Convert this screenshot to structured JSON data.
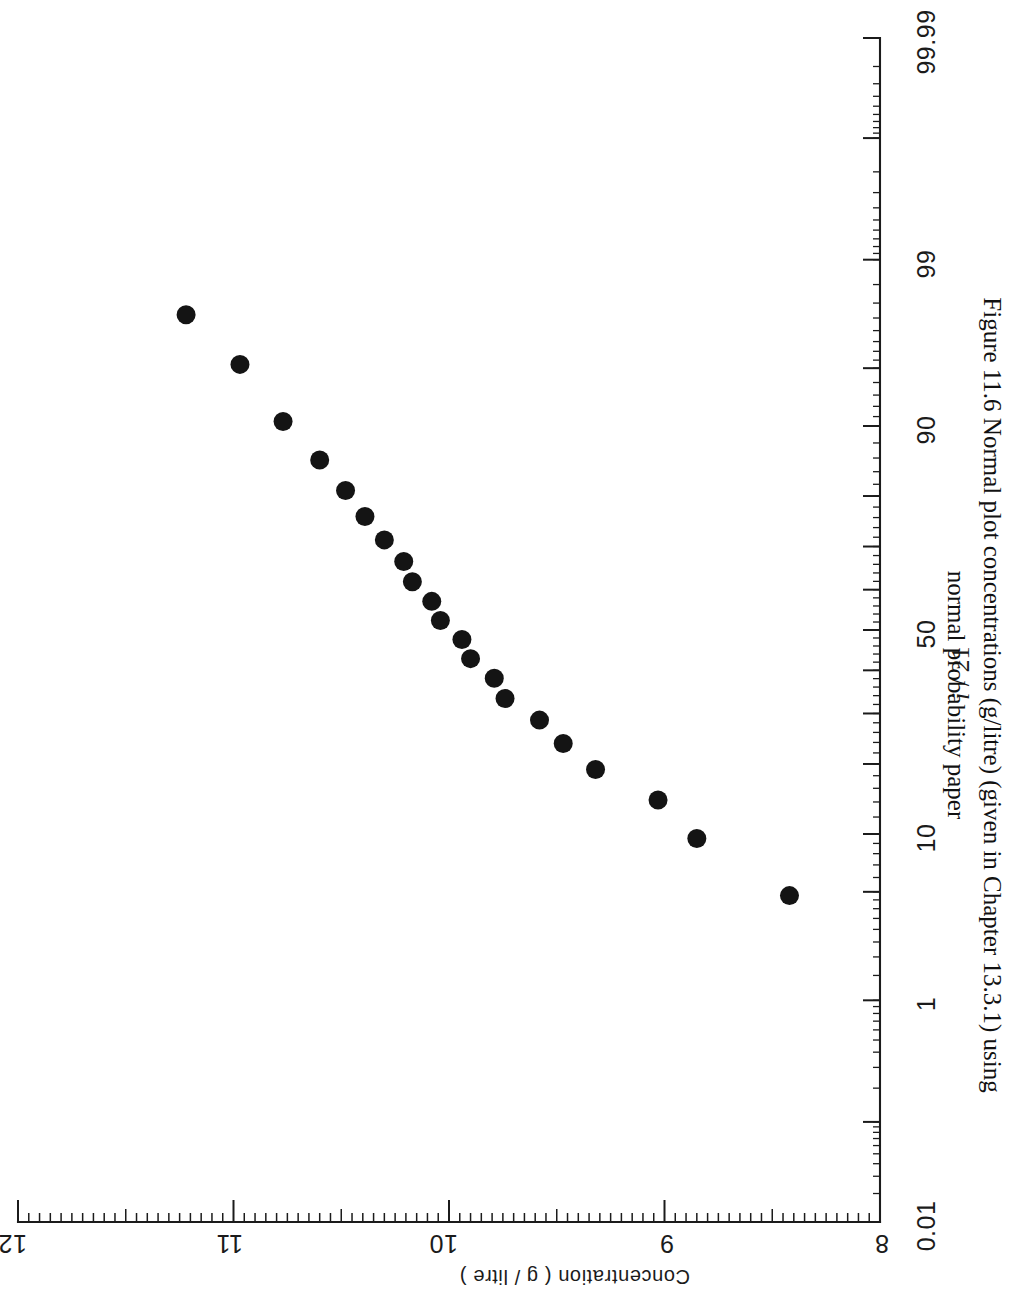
{
  "figure": {
    "caption_line1": "Figure 11.6  Normal plot concentrations (g/litre) (given in Chapter 13.3.1) using",
    "caption_line2": "normal probability paper"
  },
  "chart_data": {
    "type": "scatter",
    "title": "Figure 11.6  Normal plot concentrations (g/litre) (given in Chapter 13.3.1) using normal probability paper",
    "orientation": "page-rotated-90-clockwise",
    "grid": false,
    "legend": null,
    "xlabel": "i / 21",
    "xlabel_parts": {
      "italic": "i",
      "rest": " / 21"
    },
    "xscale": "normal-probability",
    "xlim": [
      0.01,
      99.99
    ],
    "xticks": [
      0.01,
      1,
      10,
      50,
      90,
      99,
      99.99
    ],
    "xticklabels": [
      "0.01",
      "1",
      "10",
      "50",
      "90",
      "99",
      "99.99"
    ],
    "ylabel": "Concentration ( g / litre )",
    "ylim": [
      8,
      12
    ],
    "yticks": [
      8,
      9,
      10,
      11,
      12
    ],
    "yticklabels": [
      "8",
      "9",
      "10",
      "11",
      "12"
    ],
    "n_points": 21,
    "point_marker": "filled-circle",
    "point_color": "#141414",
    "points": [
      {
        "i": 1,
        "prob": 4.76,
        "concentration": 8.42
      },
      {
        "i": 2,
        "prob": 9.52,
        "concentration": 8.85
      },
      {
        "i": 3,
        "prob": 14.29,
        "concentration": 9.03
      },
      {
        "i": 4,
        "prob": 19.05,
        "concentration": 9.32
      },
      {
        "i": 5,
        "prob": 23.81,
        "concentration": 9.47
      },
      {
        "i": 6,
        "prob": 28.57,
        "concentration": 9.58
      },
      {
        "i": 7,
        "prob": 33.33,
        "concentration": 9.74
      },
      {
        "i": 8,
        "prob": 38.1,
        "concentration": 9.79
      },
      {
        "i": 9,
        "prob": 42.86,
        "concentration": 9.9
      },
      {
        "i": 10,
        "prob": 47.62,
        "concentration": 9.94
      },
      {
        "i": 11,
        "prob": 52.38,
        "concentration": 10.04
      },
      {
        "i": 12,
        "prob": 57.14,
        "concentration": 10.08
      },
      {
        "i": 13,
        "prob": 61.9,
        "concentration": 10.17
      },
      {
        "i": 14,
        "prob": 66.67,
        "concentration": 10.21
      },
      {
        "i": 15,
        "prob": 71.43,
        "concentration": 10.3
      },
      {
        "i": 16,
        "prob": 76.19,
        "concentration": 10.39
      },
      {
        "i": 17,
        "prob": 80.95,
        "concentration": 10.48
      },
      {
        "i": 18,
        "prob": 85.71,
        "concentration": 10.6
      },
      {
        "i": 19,
        "prob": 90.48,
        "concentration": 10.77
      },
      {
        "i": 20,
        "prob": 95.24,
        "concentration": 10.97
      },
      {
        "i": 21,
        "prob": 97.62,
        "concentration": 11.22
      }
    ]
  },
  "axes": {
    "prob_labels": [
      "99.99",
      "99",
      "90",
      "50",
      "10",
      "1",
      "0.01"
    ],
    "conc_labels": [
      "12",
      "11",
      "10",
      "9",
      "8"
    ],
    "prob_title": "i / 21",
    "conc_title": "Concentration ( g / litre )"
  }
}
